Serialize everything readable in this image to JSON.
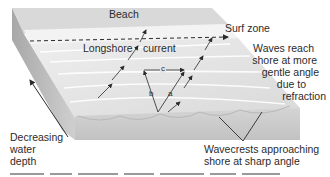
{
  "diagram": {
    "labels": {
      "beach": "Beach",
      "surf_zone": "Surf zone",
      "longshore": "Longshore",
      "current": "current",
      "waves_reach": [
        "Waves reach",
        "shore at more",
        "gentle angle",
        "due to",
        "refraction"
      ],
      "decreasing": [
        "Decreasing",
        "water",
        "depth"
      ],
      "wavecrests": [
        "Wavecrests approaching",
        "shore at sharp angle"
      ],
      "vector_a": "a",
      "vector_b": "b",
      "vector_c": "c"
    },
    "colors": {
      "block_top": "#e4e4e4",
      "block_side": "#c9c9c9",
      "block_left": "#bdbdbd",
      "surf": "#f4f4f4",
      "beach": "#d8d8d8",
      "line": "#2a2a2a"
    }
  }
}
